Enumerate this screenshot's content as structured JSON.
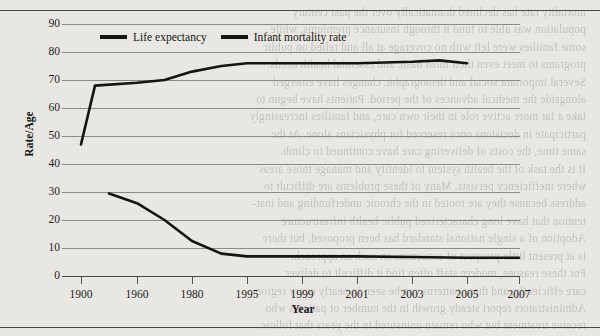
{
  "chart_data": {
    "type": "line",
    "title": "",
    "xlabel": "Year",
    "ylabel": "Rate/Age",
    "ylim": [
      0,
      90
    ],
    "yticks": [
      0,
      10,
      20,
      30,
      40,
      50,
      60,
      70,
      80,
      90
    ],
    "grid": true,
    "legend_position": "top-center",
    "categories": [
      "1900",
      "1960",
      "1980",
      "1995",
      "1999",
      "2001",
      "2003",
      "2005",
      "2007"
    ],
    "xtick_labels": [
      "1900",
      "1960",
      "1980",
      "1995",
      "1999",
      "2001",
      "2003",
      "2005",
      "2007"
    ],
    "series": [
      {
        "name": "Life expectancy",
        "color": "#15140f",
        "x": [
          1900,
          1915,
          1960,
          1970,
          1980,
          1988,
          1995,
          1999,
          2001,
          2003,
          2004,
          2005
        ],
        "values": [
          47,
          68,
          69,
          70,
          73,
          75,
          76,
          76,
          76,
          76.5,
          77,
          76
        ]
      },
      {
        "name": "Infant mortality rate",
        "color": "#15140f",
        "x": [
          1930,
          1960,
          1970,
          1980,
          1988,
          1995,
          1999,
          2001,
          2003,
          2005,
          2007
        ],
        "values": [
          29.5,
          26,
          20,
          12.5,
          8,
          7,
          7,
          7,
          6.8,
          6.5,
          6.5
        ]
      }
    ]
  },
  "legend": {
    "items": [
      {
        "label": "Life expectancy"
      },
      {
        "label": "Infant mortality rate"
      }
    ]
  },
  "axes": {
    "y_title": "Rate/Age",
    "x_title": "Year",
    "y_labels": [
      "90",
      "80",
      "70",
      "60",
      "50",
      "40",
      "30",
      "20",
      "10",
      "0"
    ],
    "x_labels": [
      "1900",
      "1960",
      "1980",
      "1995",
      "1999",
      "2001",
      "2003",
      "2005",
      "2007"
    ]
  },
  "background_text": {
    "lines": [
      "mortality rate has declined dramatically over the past century",
      "population was able to fund it through insurance premiums, while",
      "some families were left with no coverage at all and relied on public",
      "programs to meet even their most basic and essential health needs.",
      "",
      "Several important social and demographic changes have emerged",
      "alongside the medical advances of the period. Patients have begun to",
      "take a far more active role in their own care, and families increasingly",
      "participate in decisions once reserved for physicians alone. At the",
      "same time, the costs of delivering care have continued to climb.",
      "",
      "It is the task of the health system to identify and manage those areas",
      "where inefficiency persists. Many of these problems are difficult to",
      "address because they are rooted in the chronic underfunding and inat-",
      "tention that have long characterized public health infrastructure.",
      "Adoption of a single national standard has been proposed, but there",
      "is at present little prospect of consensus on such an approach.",
      "For these reasons, modern staff often find it difficult to deliver",
      "care efficiently, and these patterns can be seen in nearly every region.",
      "Administrators report steady growth in the number of patients who",
      "receive treatment but who remain uninsured in the years that follow.",
      "Public attitudes toward the proper role of government in financing",
      "care have also shifted. As people become more familiar with the way",
      "coverage is structured, they tend to favor broader participation."
    ]
  }
}
